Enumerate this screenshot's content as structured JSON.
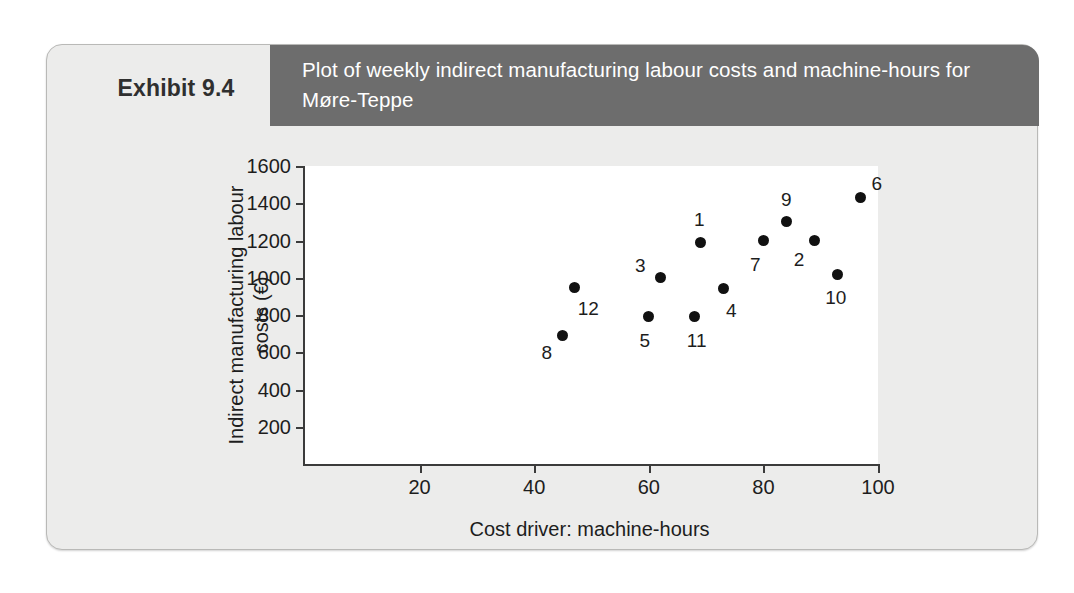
{
  "exhibit": {
    "label": "Exhibit 9.4",
    "title": "Plot of weekly indirect manufacturing labour costs and machine-hours for Møre-Teppe"
  },
  "chart_data": {
    "type": "scatter",
    "title": "Plot of weekly indirect manufacturing labour costs and machine-hours for Møre-Teppe",
    "xlabel": "Cost driver: machine-hours",
    "ylabel": "Indirect manufacturing labour costs (€)",
    "xlim": [
      0,
      100
    ],
    "ylim": [
      0,
      1600
    ],
    "xticks": [
      20,
      40,
      60,
      80,
      100
    ],
    "xtick_labels": [
      "20",
      "40",
      "60",
      "80",
      "100"
    ],
    "yticks": [
      200,
      400,
      600,
      800,
      1000,
      1200,
      1400,
      1600
    ],
    "ytick_labels": [
      "200",
      "400",
      "600",
      "800",
      "1000",
      "1200",
      "1400",
      "1600"
    ],
    "grid": false,
    "legend": null,
    "marker": "filled-circle",
    "marker_color": "#111111",
    "points": [
      {
        "label": "8",
        "x": 45,
        "y": 690,
        "label_dx": -16,
        "label_dy": 18
      },
      {
        "label": "12",
        "x": 47,
        "y": 950,
        "label_dx": 14,
        "label_dy": 22
      },
      {
        "label": "5",
        "x": 60,
        "y": 790,
        "label_dx": -4,
        "label_dy": 24
      },
      {
        "label": "3",
        "x": 62,
        "y": 1000,
        "label_dx": -20,
        "label_dy": -12
      },
      {
        "label": "11",
        "x": 68,
        "y": 790,
        "label_dx": 2,
        "label_dy": 24
      },
      {
        "label": "1",
        "x": 69,
        "y": 1190,
        "label_dx": -1,
        "label_dy": -22
      },
      {
        "label": "4",
        "x": 73,
        "y": 940,
        "label_dx": 8,
        "label_dy": 22
      },
      {
        "label": "7",
        "x": 80,
        "y": 1200,
        "label_dx": -8,
        "label_dy": 24
      },
      {
        "label": "9",
        "x": 84,
        "y": 1300,
        "label_dx": 0,
        "label_dy": -22
      },
      {
        "label": "2",
        "x": 89,
        "y": 1200,
        "label_dx": -16,
        "label_dy": 19
      },
      {
        "label": "10",
        "x": 93,
        "y": 1020,
        "label_dx": -2,
        "label_dy": 24
      },
      {
        "label": "6",
        "x": 97,
        "y": 1430,
        "label_dx": 16,
        "label_dy": -14
      }
    ]
  }
}
